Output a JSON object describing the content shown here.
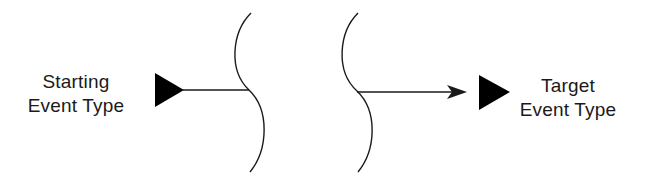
{
  "diagram": {
    "type": "event-sequence-with-time-gap",
    "colors": {
      "stroke": "#1a1a1a",
      "fill": "#000000",
      "background": "#ffffff"
    },
    "start_node": {
      "label_line1": "Starting",
      "label_line2": "Event Type",
      "symbol": "filled-right-triangle"
    },
    "target_node": {
      "label_line1": "Target",
      "label_line2": "Event Type",
      "symbol": "filled-right-triangle"
    },
    "connector": {
      "style": "line-with-break",
      "break_symbol": "double-wavy-break",
      "end": "arrowhead"
    }
  }
}
